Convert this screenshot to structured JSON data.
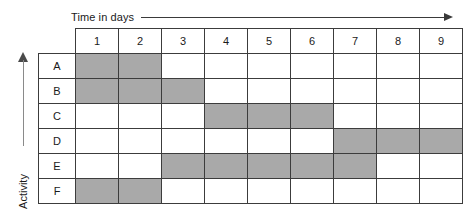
{
  "axes": {
    "x_label": "Time in days",
    "y_label": "Activity"
  },
  "chart_data": {
    "type": "heatmap",
    "title": "",
    "subtitle": "",
    "xlabel": "Time in days",
    "ylabel": "Activity",
    "grid": true,
    "legend": "none",
    "columns": [
      "1",
      "2",
      "3",
      "4",
      "5",
      "6",
      "7",
      "8",
      "9"
    ],
    "rows": [
      "A",
      "B",
      "C",
      "D",
      "E",
      "F"
    ],
    "fill_color": "#a9a9a9",
    "empty_color": "#ffffff",
    "border_color": "#3c3c3c",
    "cells": [
      [
        1,
        1,
        0,
        0,
        0,
        0,
        0,
        0,
        0
      ],
      [
        1,
        1,
        1,
        0,
        0,
        0,
        0,
        0,
        0
      ],
      [
        0,
        0,
        0,
        1,
        1,
        1,
        0,
        0,
        0
      ],
      [
        0,
        0,
        0,
        0,
        0,
        0,
        1,
        1,
        1
      ],
      [
        0,
        0,
        1,
        1,
        1,
        1,
        1,
        0,
        0
      ],
      [
        1,
        1,
        0,
        0,
        0,
        0,
        0,
        0,
        0
      ]
    ],
    "bars": [
      {
        "activity": "A",
        "start_day": 1,
        "end_day": 2,
        "duration": 2
      },
      {
        "activity": "B",
        "start_day": 1,
        "end_day": 3,
        "duration": 3
      },
      {
        "activity": "C",
        "start_day": 4,
        "end_day": 6,
        "duration": 3
      },
      {
        "activity": "D",
        "start_day": 7,
        "end_day": 9,
        "duration": 3
      },
      {
        "activity": "E",
        "start_day": 3,
        "end_day": 7,
        "duration": 5
      },
      {
        "activity": "F",
        "start_day": 1,
        "end_day": 2,
        "duration": 2
      }
    ]
  }
}
